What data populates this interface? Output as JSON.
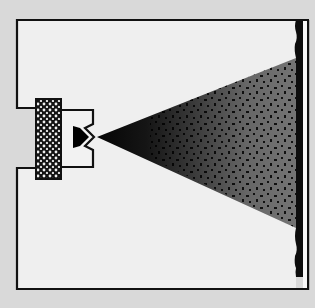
{
  "diagram": {
    "type": "schematic",
    "colors": {
      "background": "#d9d9d9",
      "enclosure_fill": "#efefef",
      "stroke": "#111111",
      "cone_dark": "#0a0a0a",
      "cone_mid": "#6e6e6e",
      "screen_bar": "#0d0d0d",
      "screen_strip": "#f7f7f7"
    },
    "elements": [
      {
        "id": "enclosure",
        "label": ""
      },
      {
        "id": "source-block",
        "label": ""
      },
      {
        "id": "nozzle",
        "label": ""
      },
      {
        "id": "particle-cone",
        "label": ""
      },
      {
        "id": "screen",
        "label": ""
      }
    ]
  }
}
